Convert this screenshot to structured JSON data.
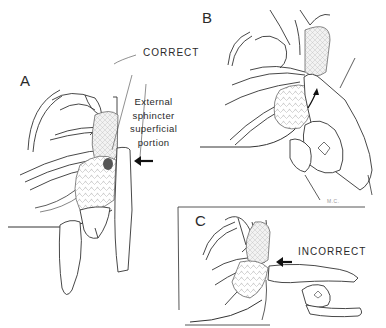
{
  "figure": {
    "panels": [
      {
        "id": "A",
        "label": "A",
        "caption": "CORRECT"
      },
      {
        "id": "B",
        "label": "B"
      },
      {
        "id": "C",
        "label": "C",
        "caption": "INCORRECT"
      }
    ],
    "annotation": {
      "lines": [
        "External",
        "sphincter",
        "superficial",
        "portion"
      ]
    },
    "signature": "M.C.",
    "colors": {
      "ink": "#2a2a2a",
      "shade": "#bdbdbd",
      "dark_shade": "#555555",
      "background": "#ffffff"
    }
  }
}
